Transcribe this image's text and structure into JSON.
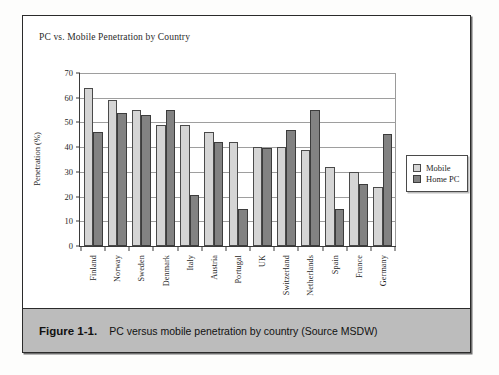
{
  "figure": {
    "caption_number": "Figure 1-1.",
    "caption_text": "PC versus mobile penetration by country (Source MSDW)"
  },
  "chart_data": {
    "type": "bar",
    "title": "PC vs. Mobile Penetration by Country",
    "xlabel": "",
    "ylabel": "Penetration (%)",
    "ylim": [
      0,
      70
    ],
    "yticks": [
      0,
      10,
      20,
      30,
      40,
      50,
      60,
      70
    ],
    "grid": true,
    "legend_position": "right",
    "categories": [
      "Finland",
      "Norway",
      "Sweden",
      "Denmark",
      "Italy",
      "Austria",
      "Portugal",
      "UK",
      "Switzerland",
      "Netherlands",
      "Spain",
      "France",
      "Germany"
    ],
    "series": [
      {
        "name": "Mobile",
        "color": "#d5d5d5",
        "values": [
          64,
          59,
          55,
          49,
          49,
          46,
          42,
          40,
          40,
          39,
          32,
          30,
          24
        ]
      },
      {
        "name": "Home PC",
        "color": "#828282",
        "values": [
          46,
          54,
          53,
          55,
          20.5,
          42,
          15,
          39.5,
          47,
          55,
          15,
          25,
          45.5
        ]
      }
    ]
  }
}
